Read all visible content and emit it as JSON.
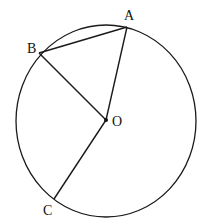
{
  "diagram": {
    "type": "circle-geometry",
    "circle": {
      "cx": 106,
      "cy": 121,
      "rx": 90,
      "ry": 96
    },
    "points": {
      "A": {
        "x": 127,
        "y": 27,
        "label": "A",
        "lx": 124,
        "ly": 20
      },
      "B": {
        "x": 39,
        "y": 53,
        "label": "B",
        "lx": 27,
        "ly": 53
      },
      "O": {
        "x": 106,
        "y": 120,
        "label": "O",
        "lx": 112,
        "ly": 126
      },
      "C": {
        "x": 54,
        "y": 199,
        "label": "C",
        "lx": 43,
        "ly": 215
      }
    },
    "segments": [
      [
        "A",
        "B"
      ],
      [
        "B",
        "O"
      ],
      [
        "A",
        "O"
      ],
      [
        "O",
        "C"
      ]
    ],
    "stroke": "#1a1a1a"
  }
}
